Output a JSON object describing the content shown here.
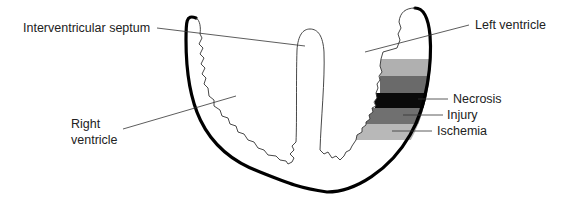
{
  "labels": {
    "interventricular_septum": "Interventricular septum",
    "left_ventricle": "Left ventricle",
    "right_ventricle": "Right\nventricle",
    "necrosis": "Necrosis",
    "injury": "Injury",
    "ischemia": "Ischemia"
  },
  "zones": [
    {
      "name": "ischemia-upper",
      "color": "#b0b0b0"
    },
    {
      "name": "injury-upper",
      "color": "#6a6a6a"
    },
    {
      "name": "necrosis",
      "color": "#0a0a0a"
    },
    {
      "name": "injury-lower",
      "color": "#707070"
    },
    {
      "name": "ischemia-lower",
      "color": "#b8b8b8"
    }
  ]
}
